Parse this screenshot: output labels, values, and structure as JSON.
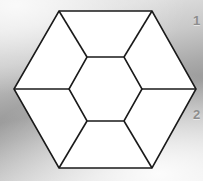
{
  "figure": {
    "background": {
      "style": "gray-gradient",
      "light_color": "#e6e6e6",
      "dark_color": "#9a9a9a"
    },
    "stroke_color": "#1a1a1a",
    "fill_color": "#ffffff",
    "stroke_width": 1.6,
    "outer_hexagon": {
      "name": "outer-hexagon",
      "vertices": [
        {
          "id": "top-left",
          "x": 59,
          "y": 11
        },
        {
          "id": "top-right",
          "x": 152,
          "y": 11
        },
        {
          "id": "right",
          "x": 196,
          "y": 89
        },
        {
          "id": "bottom-right",
          "x": 152,
          "y": 168
        },
        {
          "id": "bottom-left",
          "x": 59,
          "y": 168
        },
        {
          "id": "left",
          "x": 14,
          "y": 89
        }
      ]
    },
    "inner_hexagon": {
      "name": "inner-hexagon",
      "vertices": [
        {
          "id": "top-left",
          "x": 87,
          "y": 57
        },
        {
          "id": "top-right",
          "x": 124,
          "y": 57
        },
        {
          "id": "right",
          "x": 142,
          "y": 89
        },
        {
          "id": "bottom-right",
          "x": 124,
          "y": 121
        },
        {
          "id": "bottom-left",
          "x": 87,
          "y": 121
        },
        {
          "id": "left",
          "x": 69,
          "y": 89
        }
      ]
    },
    "connector_segments": [
      {
        "name": "connector-top-left",
        "x1": 59,
        "y1": 11,
        "x2": 87,
        "y2": 57
      },
      {
        "name": "connector-top-right",
        "x1": 152,
        "y1": 11,
        "x2": 124,
        "y2": 57
      },
      {
        "name": "connector-left",
        "x1": 14,
        "y1": 89,
        "x2": 69,
        "y2": 89
      },
      {
        "name": "connector-right",
        "x1": 196,
        "y1": 89,
        "x2": 142,
        "y2": 89
      },
      {
        "name": "connector-bottom-left",
        "x1": 59,
        "y1": 168,
        "x2": 87,
        "y2": 121
      },
      {
        "name": "connector-bottom-right",
        "x1": 152,
        "y1": 168,
        "x2": 124,
        "y2": 121
      }
    ],
    "regions": [
      {
        "name": "region-top",
        "points": "59,11 152,11 124,57 87,57"
      },
      {
        "name": "region-upper-right",
        "points": "152,11 196,89 142,89 124,57"
      },
      {
        "name": "region-lower-right",
        "points": "196,89 152,168 124,121 142,89"
      },
      {
        "name": "region-bottom",
        "points": "152,168 59,168 87,121 124,121"
      },
      {
        "name": "region-lower-left",
        "points": "59,168 14,89 69,89 87,121"
      },
      {
        "name": "region-upper-left",
        "points": "14,89 59,11 87,57 69,89"
      },
      {
        "name": "region-center",
        "points": "87,57 124,57 142,89 124,121 87,121 69,89"
      }
    ]
  },
  "labels": [
    {
      "name": "label-1",
      "text": "1",
      "color": "#8d8d8d"
    },
    {
      "name": "label-2",
      "text": "2",
      "color": "#8d8d8d"
    }
  ]
}
